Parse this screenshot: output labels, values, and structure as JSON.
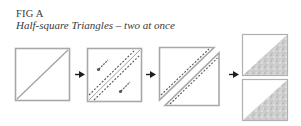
{
  "figure": {
    "title": "FIG A",
    "subtitle": "Half-square Triangles – two at once"
  },
  "steps": [
    {
      "name": "square-with-diagonal",
      "description": "Square with diagonal line drawn"
    },
    {
      "name": "stitch-both-sides",
      "description": "Stitched 1/4 inch on both sides of diagonal, pinned"
    },
    {
      "name": "cut-on-diagonal",
      "description": "Cut apart on the diagonal"
    },
    {
      "name": "two-finished-units",
      "description": "Two half-square triangle units"
    }
  ],
  "colors": {
    "outline": "#a8a8a8",
    "line": "#9a9a9a",
    "stitch": "#555555",
    "arrow": "#1e1e1e",
    "fabric": "#c9c9c9"
  }
}
